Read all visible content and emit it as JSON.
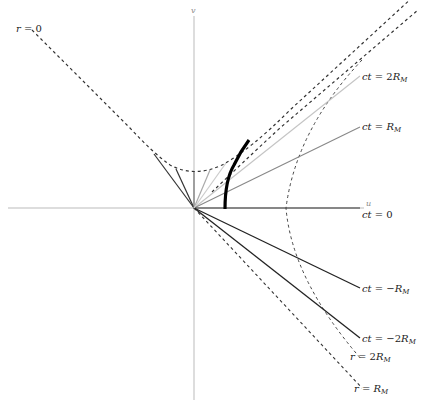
{
  "diagram": {
    "type": "Kruskal-Szekeres style spacetime diagram",
    "axes": {
      "horizontal": {
        "label": "u"
      },
      "vertical": {
        "label": "v"
      }
    },
    "time_slices": [
      {
        "label": "ct = 2R",
        "sub": "M",
        "style": "light-gray"
      },
      {
        "label": "ct = R",
        "sub": "M",
        "style": "gray"
      },
      {
        "label": "ct = 0",
        "sub": "",
        "style": "dark"
      },
      {
        "label": "ct = −R",
        "sub": "M",
        "style": "dark"
      },
      {
        "label": "ct = −2R",
        "sub": "M",
        "style": "dark"
      }
    ],
    "radius_curves": [
      {
        "label": "r = 0",
        "sub": "",
        "style": "dashed"
      },
      {
        "label": "r = 2R",
        "sub": "M",
        "style": "dashed"
      },
      {
        "label": "r = R",
        "sub": "M",
        "style": "dashed"
      }
    ],
    "worldline": {
      "description": "thick black worldline of infalling surface",
      "style": "bold"
    }
  },
  "colors": {
    "axis": "#999999",
    "dark_line": "#222222",
    "gray_line": "#888888",
    "light_line": "#c4c4c4",
    "dashed": "#333333",
    "worldline": "#000000"
  }
}
